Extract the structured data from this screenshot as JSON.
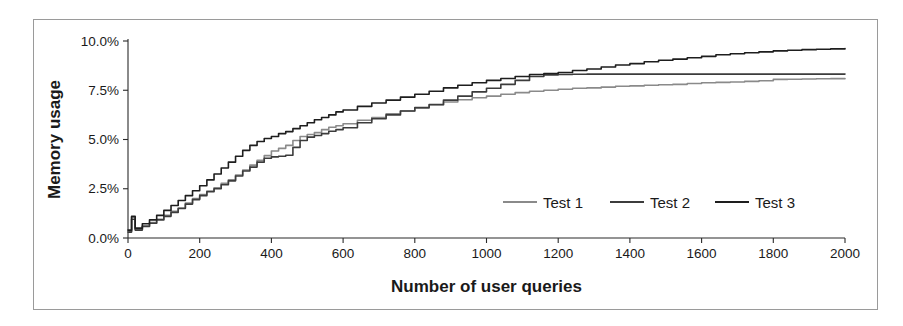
{
  "chart_data": {
    "type": "line",
    "title": "",
    "xlabel": "Number of user queries",
    "ylabel": "Memory usage",
    "xlim": [
      0,
      2000
    ],
    "ylim": [
      0,
      10
    ],
    "xticks": [
      0,
      200,
      400,
      600,
      800,
      1000,
      1200,
      1400,
      1600,
      1800,
      2000
    ],
    "xtick_labels": [
      "0",
      "200",
      "400",
      "600",
      "800",
      "1000",
      "1200",
      "1400",
      "1600",
      "1800",
      "2000"
    ],
    "yticks": [
      0,
      2.5,
      5,
      7.5,
      10
    ],
    "ytick_labels": [
      "0.0%",
      "2.5%",
      "5.0%",
      "7.5%",
      "10.0%"
    ],
    "grid": false,
    "legend_position": "inside-lower-right",
    "y_unit": "%",
    "series": [
      {
        "name": "Test 1",
        "color": "#8a8a8a",
        "x": [
          0,
          10,
          20,
          40,
          60,
          80,
          100,
          120,
          140,
          160,
          180,
          200,
          220,
          240,
          260,
          280,
          300,
          320,
          340,
          360,
          380,
          400,
          420,
          440,
          460,
          480,
          500,
          520,
          540,
          560,
          580,
          600,
          640,
          680,
          720,
          760,
          800,
          840,
          880,
          920,
          960,
          1000,
          1040,
          1080,
          1120,
          1160,
          1200,
          1240,
          1280,
          1320,
          1360,
          1400,
          1440,
          1480,
          1520,
          1560,
          1600,
          1640,
          1680,
          1720,
          1760,
          1800,
          1840,
          1880,
          1920,
          1960,
          2000
        ],
        "values": [
          0.35,
          1.05,
          0.45,
          0.62,
          0.78,
          0.95,
          1.15,
          1.35,
          1.52,
          1.78,
          2.0,
          2.2,
          2.38,
          2.55,
          2.78,
          2.95,
          3.2,
          3.45,
          3.7,
          3.95,
          4.18,
          4.42,
          4.55,
          4.7,
          4.95,
          5.15,
          5.25,
          5.35,
          5.5,
          5.62,
          5.7,
          5.8,
          5.98,
          6.12,
          6.3,
          6.45,
          6.6,
          6.75,
          6.9,
          7.02,
          7.12,
          7.2,
          7.3,
          7.38,
          7.45,
          7.5,
          7.55,
          7.6,
          7.62,
          7.66,
          7.7,
          7.72,
          7.75,
          7.78,
          7.8,
          7.84,
          7.88,
          7.9,
          7.92,
          7.95,
          7.98,
          8.05,
          8.06,
          8.07,
          8.08,
          8.09,
          8.1
        ]
      },
      {
        "name": "Test 2",
        "color": "#3c3c3c",
        "x": [
          0,
          10,
          20,
          40,
          60,
          80,
          100,
          120,
          140,
          160,
          180,
          200,
          220,
          240,
          260,
          280,
          300,
          320,
          340,
          360,
          380,
          400,
          420,
          440,
          460,
          480,
          500,
          520,
          540,
          560,
          580,
          600,
          640,
          680,
          720,
          760,
          800,
          840,
          880,
          920,
          960,
          1000,
          1040,
          1080,
          1120,
          1160,
          1200,
          1240,
          1280,
          1320,
          1360,
          1400,
          1440,
          1480,
          1520,
          1560,
          1600,
          1640,
          1680,
          1720,
          1760,
          1800,
          1840,
          1880,
          1920,
          1960,
          2000
        ],
        "values": [
          0.3,
          0.95,
          0.4,
          0.58,
          0.75,
          0.92,
          1.1,
          1.3,
          1.5,
          1.72,
          1.95,
          2.15,
          2.35,
          2.5,
          2.7,
          2.9,
          3.15,
          3.4,
          3.6,
          3.85,
          4.05,
          4.12,
          4.15,
          4.2,
          4.6,
          4.95,
          5.12,
          5.2,
          5.3,
          5.42,
          5.5,
          5.6,
          5.85,
          6.05,
          6.25,
          6.45,
          6.62,
          6.78,
          7.0,
          7.2,
          7.42,
          7.6,
          7.8,
          8.0,
          8.2,
          8.28,
          8.3,
          8.31,
          8.32,
          8.32,
          8.32,
          8.32,
          8.32,
          8.32,
          8.32,
          8.32,
          8.32,
          8.32,
          8.32,
          8.32,
          8.32,
          8.32,
          8.32,
          8.32,
          8.32,
          8.32,
          8.32
        ]
      },
      {
        "name": "Test 3",
        "color": "#1e1e1e",
        "x": [
          0,
          10,
          20,
          40,
          60,
          80,
          100,
          120,
          140,
          160,
          180,
          200,
          220,
          240,
          260,
          280,
          300,
          320,
          340,
          360,
          380,
          400,
          420,
          440,
          460,
          480,
          500,
          520,
          540,
          560,
          580,
          600,
          640,
          680,
          720,
          760,
          800,
          840,
          880,
          920,
          960,
          1000,
          1040,
          1080,
          1120,
          1160,
          1200,
          1240,
          1280,
          1320,
          1360,
          1400,
          1440,
          1480,
          1520,
          1560,
          1600,
          1640,
          1680,
          1720,
          1760,
          1800,
          1840,
          1880,
          1920,
          1960,
          2000
        ],
        "values": [
          0.4,
          1.1,
          0.5,
          0.72,
          0.92,
          1.15,
          1.4,
          1.65,
          1.9,
          2.15,
          2.4,
          2.65,
          2.95,
          3.25,
          3.55,
          3.85,
          4.15,
          4.45,
          4.7,
          4.9,
          5.05,
          5.15,
          5.3,
          5.4,
          5.55,
          5.7,
          5.85,
          6.0,
          6.12,
          6.25,
          6.4,
          6.5,
          6.68,
          6.85,
          7.0,
          7.15,
          7.3,
          7.45,
          7.62,
          7.75,
          7.88,
          8.0,
          8.1,
          8.2,
          8.3,
          8.35,
          8.4,
          8.5,
          8.58,
          8.68,
          8.78,
          8.85,
          8.95,
          9.02,
          9.08,
          9.15,
          9.22,
          9.3,
          9.35,
          9.4,
          9.45,
          9.5,
          9.53,
          9.56,
          9.58,
          9.6,
          9.62
        ]
      }
    ]
  },
  "legend": {
    "entries": [
      {
        "label": "Test 1",
        "color": "#8a8a8a"
      },
      {
        "label": "Test 2",
        "color": "#3c3c3c"
      },
      {
        "label": "Test 3",
        "color": "#1e1e1e"
      }
    ]
  },
  "axes": {
    "y_title": "Memory usage",
    "x_title": "Number of user queries"
  },
  "style": {
    "frame_color": "#9a9a9a",
    "axis_color": "#2a2a2a",
    "text_color": "#1a1a1a",
    "background": "#ffffff"
  }
}
